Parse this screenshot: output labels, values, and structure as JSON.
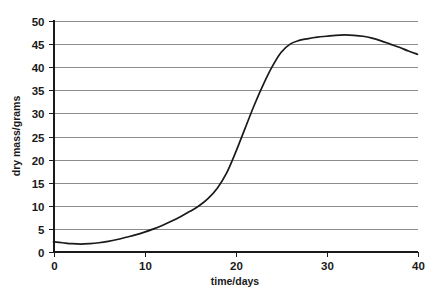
{
  "chart_data": {
    "type": "line",
    "title": "",
    "subtitle": "",
    "xlabel": "time/days",
    "ylabel": "dry mass/grams",
    "xlim": [
      0,
      40
    ],
    "ylim": [
      0,
      50
    ],
    "xticks": [
      0,
      10,
      20,
      30,
      40
    ],
    "yticks": [
      0,
      5,
      10,
      15,
      20,
      25,
      30,
      35,
      40,
      45,
      50
    ],
    "xtick_labels": [
      "0",
      "10",
      "20",
      "30",
      "40"
    ],
    "ytick_labels": [
      "0",
      "5",
      "10",
      "15",
      "20",
      "25",
      "30",
      "35",
      "40",
      "45",
      "50"
    ],
    "grid": "horizontal",
    "legend": "none",
    "series": [
      {
        "name": "dry mass",
        "color": "#1a1a1a",
        "x": [
          0,
          1,
          2,
          3,
          4,
          5,
          6,
          7,
          8,
          9,
          10,
          11,
          12,
          13,
          14,
          15,
          16,
          17,
          18,
          19,
          20,
          21,
          22,
          23,
          24,
          25,
          26,
          27,
          28,
          29,
          30,
          31,
          32,
          33,
          34,
          35,
          36,
          37,
          38,
          39,
          40
        ],
        "values": [
          2.2,
          2.0,
          1.8,
          1.7,
          1.8,
          2.0,
          2.3,
          2.7,
          3.2,
          3.7,
          4.3,
          5.0,
          5.8,
          6.7,
          7.7,
          8.8,
          10.0,
          11.6,
          13.8,
          17.0,
          21.5,
          26.5,
          31.5,
          36.0,
          40.0,
          43.2,
          45.0,
          45.8,
          46.2,
          46.5,
          46.7,
          46.9,
          47.0,
          46.9,
          46.7,
          46.3,
          45.7,
          45.0,
          44.3,
          43.5,
          42.8
        ]
      }
    ]
  },
  "axes": {
    "y_axis_label": "dry mass/grams",
    "x_axis_label": "time/days"
  }
}
